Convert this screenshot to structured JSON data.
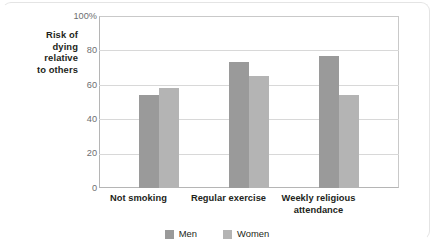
{
  "chart_data": {
    "type": "bar",
    "title": "",
    "subtitle": "",
    "xlabel": "",
    "ylabel": "Risk of dying relative to others",
    "ylabel_lines": [
      "Risk of",
      "dying",
      "relative",
      "to others"
    ],
    "categories": [
      "Not smoking",
      "Regular exercise",
      "Weekly religious attendance"
    ],
    "category_lines": [
      [
        "Not smoking"
      ],
      [
        "Regular exercise"
      ],
      [
        "Weekly religious",
        "attendance"
      ]
    ],
    "series": [
      {
        "name": "Men",
        "values": [
          54,
          73,
          77
        ],
        "color": "#9a9a9a"
      },
      {
        "name": "Women",
        "values": [
          58,
          65,
          54
        ],
        "color": "#b4b4b4"
      }
    ],
    "ylim": [
      0,
      100
    ],
    "ytick_values": [
      100,
      80,
      60,
      40,
      20,
      0
    ],
    "ytick_labels": [
      "100%",
      "80",
      "60",
      "40",
      "20",
      "0"
    ],
    "grid": true,
    "legend_position": "bottom-center"
  },
  "colors": {
    "men": "#9a9a9a",
    "women": "#b4b4b4",
    "gridline": "#d8d8d8",
    "axis": "#b5b5b5",
    "text": "#231f20",
    "tick_text": "#6d6e71",
    "frame": "#e4e4e4",
    "background": "#ffffff"
  },
  "legend": {
    "entries": [
      {
        "label": "Men"
      },
      {
        "label": "Women"
      }
    ]
  }
}
